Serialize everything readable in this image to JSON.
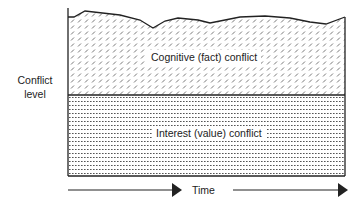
{
  "diagram": {
    "y_axis_label_line1": "Conflict",
    "y_axis_label_line2": "level",
    "x_axis_label": "Time",
    "regions": [
      {
        "name": "upper",
        "label": "Cognitive (fact) conflict",
        "pattern": "diagonal-dash"
      },
      {
        "name": "lower",
        "label": "Interest (value) conflict",
        "pattern": "horizontal-dot"
      }
    ],
    "colors": {
      "line": "#222222",
      "pattern": "#555555",
      "background": "#ffffff"
    }
  }
}
